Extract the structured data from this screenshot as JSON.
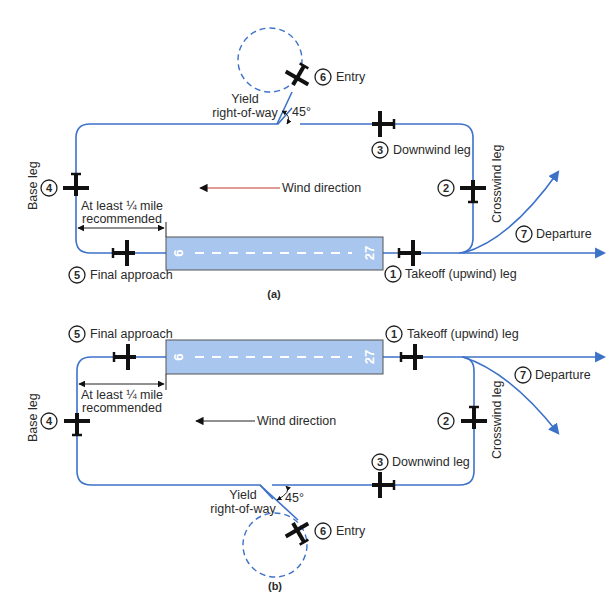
{
  "figure": {
    "colors": {
      "pattern_line": "#3d72c9",
      "runway_fill": "#a9c6ee",
      "wind_arrow_line": "#c0392b",
      "aircraft": "#111111"
    },
    "panels": [
      {
        "caption": "(a)",
        "runway": {
          "left_number": "9",
          "right_number": "27"
        },
        "wind_label": "Wind direction",
        "distance_label_line1": "At least ¼ mile",
        "distance_label_line2": "recommended",
        "yield_line1": "Yield",
        "yield_line2": "right-of-way",
        "angle_label": "45°",
        "legs": [
          {
            "number": "1",
            "label": "Takeoff (upwind) leg"
          },
          {
            "number": "2",
            "label": "Crosswind leg"
          },
          {
            "number": "3",
            "label": "Downwind leg"
          },
          {
            "number": "4",
            "label": "Base leg"
          },
          {
            "number": "5",
            "label": "Final approach"
          },
          {
            "number": "6",
            "label": "Entry"
          },
          {
            "number": "7",
            "label": "Departure"
          }
        ]
      },
      {
        "caption": "(b)",
        "runway": {
          "left_number": "9",
          "right_number": "27"
        },
        "wind_label": "Wind direction",
        "distance_label_line1": "At least ¼ mile",
        "distance_label_line2": "recommended",
        "yield_line1": "Yield",
        "yield_line2": "right-of-way",
        "angle_label": "45°",
        "legs": [
          {
            "number": "1",
            "label": "Takeoff (upwind) leg"
          },
          {
            "number": "2",
            "label": "Crosswind leg"
          },
          {
            "number": "3",
            "label": "Downwind leg"
          },
          {
            "number": "4",
            "label": "Base leg"
          },
          {
            "number": "5",
            "label": "Final approach"
          },
          {
            "number": "6",
            "label": "Entry"
          },
          {
            "number": "7",
            "label": "Departure"
          }
        ]
      }
    ]
  }
}
